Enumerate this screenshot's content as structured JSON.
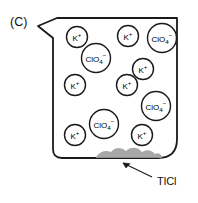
{
  "figure": {
    "panel_label": "(C)",
    "container": {
      "name": "beaker",
      "has_pour_spout": true,
      "outline_color": "#1a1a1a",
      "fill_color": "#ffffff",
      "line_width": 1.8
    },
    "precipitate": {
      "label": "TlCl",
      "color": "#a8a8a8",
      "shadow_color": "#8f8f8f",
      "annotation_arrow": true
    },
    "ions": [
      {
        "id": "ion-1",
        "species": "K",
        "charge": "+",
        "sub": "",
        "kind": "cation",
        "cx": 77,
        "cy": 37,
        "r": 10.5
      },
      {
        "id": "ion-2",
        "species": "K",
        "charge": "+",
        "sub": "",
        "kind": "cation",
        "cx": 128,
        "cy": 36,
        "r": 10.5
      },
      {
        "id": "ion-3",
        "species": "ClO",
        "charge": "−",
        "sub": "4",
        "kind": "anion",
        "cx": 162,
        "cy": 38,
        "r": 14.5
      },
      {
        "id": "ion-4",
        "species": "ClO",
        "charge": "−",
        "sub": "4",
        "kind": "anion",
        "cx": 96,
        "cy": 58,
        "r": 14.5
      },
      {
        "id": "ion-5",
        "species": "K",
        "charge": "+",
        "sub": "",
        "kind": "cation",
        "cx": 143,
        "cy": 69,
        "r": 10.5
      },
      {
        "id": "ion-6",
        "species": "K",
        "charge": "+",
        "sub": "",
        "kind": "cation",
        "cx": 75,
        "cy": 85,
        "r": 10.5
      },
      {
        "id": "ion-7",
        "species": "K",
        "charge": "+",
        "sub": "",
        "kind": "cation",
        "cx": 127,
        "cy": 85,
        "r": 10.5
      },
      {
        "id": "ion-8",
        "species": "ClO",
        "charge": "−",
        "sub": "4",
        "kind": "anion",
        "cx": 156,
        "cy": 106,
        "r": 14.5
      },
      {
        "id": "ion-9",
        "species": "ClO",
        "charge": "−",
        "sub": "4",
        "kind": "anion",
        "cx": 104,
        "cy": 124,
        "r": 14.5
      },
      {
        "id": "ion-10",
        "species": "K",
        "charge": "+",
        "sub": "",
        "kind": "cation",
        "cx": 75,
        "cy": 135,
        "r": 10.5
      },
      {
        "id": "ion-11",
        "species": "K",
        "charge": "+",
        "sub": "",
        "kind": "cation",
        "cx": 142,
        "cy": 135,
        "r": 10.5
      }
    ],
    "legend_note": ""
  }
}
